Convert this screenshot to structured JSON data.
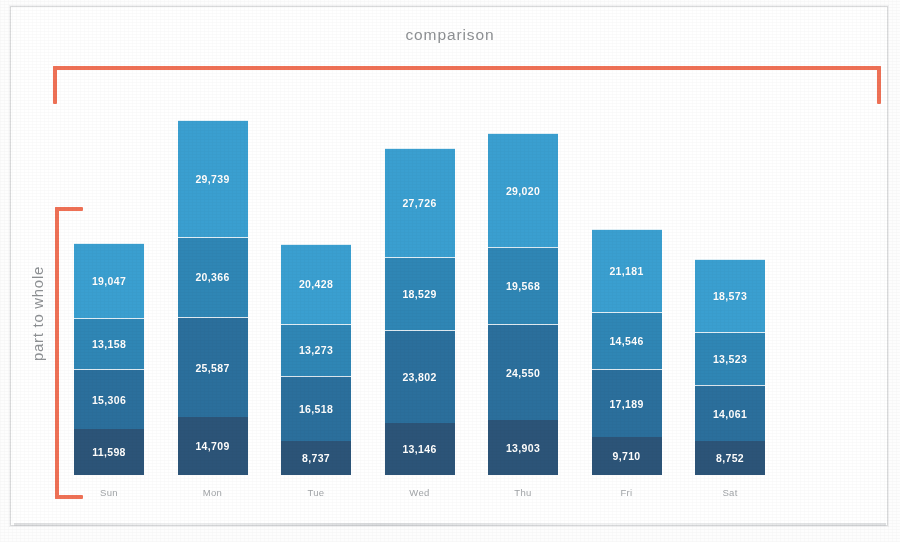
{
  "title": "comparison",
  "axis_label_vertical": "part to whole",
  "colors": {
    "accent_bracket": "#ef7156",
    "title_text": "#8d9093",
    "category_text": "#a2a5a8",
    "value_text": "#ffffff",
    "page_background": "#ffffff",
    "page_border": "#d9dadb",
    "series": [
      "#2c5478",
      "#2b6f9c",
      "#2f86b5",
      "#3a9fd0"
    ]
  },
  "chart_data": {
    "type": "bar",
    "variant": "stacked",
    "title": "comparison",
    "xlabel": "",
    "ylabel": "part to whole",
    "grid": false,
    "legend": "none",
    "axis_visible": false,
    "value_labels": true,
    "value_label_format": "comma-separated integer",
    "categories": [
      "Sun",
      "Mon",
      "Tue",
      "Wed",
      "Thu",
      "Fri",
      "Sat"
    ],
    "series": [
      {
        "name": "Series 1",
        "color": "#2c5478",
        "stack_position": "bottom",
        "values": [
          11598,
          14709,
          8737,
          13146,
          13903,
          9710,
          8752
        ],
        "labels": [
          "11,598",
          "14,709",
          "8,737",
          "13,146",
          "13,903",
          "9,710",
          "8,752"
        ]
      },
      {
        "name": "Series 2",
        "color": "#2b6f9c",
        "stack_position": "second",
        "values": [
          15306,
          25587,
          16518,
          23802,
          24550,
          17189,
          14061
        ],
        "labels": [
          "15,306",
          "25,587",
          "16,518",
          "23,802",
          "24,550",
          "17,189",
          "14,061"
        ]
      },
      {
        "name": "Series 3",
        "color": "#2f86b5",
        "stack_position": "third",
        "values": [
          13158,
          20366,
          13273,
          18529,
          19568,
          14546,
          13523
        ],
        "labels": [
          "13,158",
          "20,366",
          "13,273",
          "18,529",
          "19,568",
          "14,546",
          "13,523"
        ]
      },
      {
        "name": "Series 4",
        "color": "#3a9fd0",
        "stack_position": "top",
        "values": [
          19047,
          29739,
          20428,
          27726,
          29020,
          21181,
          18573
        ],
        "labels": [
          "19,047",
          "29,739",
          "20,428",
          "27,726",
          "29,020",
          "21,181",
          "18,573"
        ]
      }
    ],
    "totals": [
      59109,
      90401,
      58956,
      83203,
      87041,
      62626,
      54909
    ],
    "ylim": [
      0,
      90401
    ]
  },
  "annotations": [
    {
      "name": "comparison-bracket",
      "label": "comparison",
      "orientation": "horizontal",
      "color": "#ef7156",
      "spans": "all seven category bars"
    },
    {
      "name": "part-to-whole-bracket",
      "label": "part to whole",
      "orientation": "vertical",
      "color": "#ef7156",
      "spans": "full stacked height of the first bar"
    }
  ]
}
